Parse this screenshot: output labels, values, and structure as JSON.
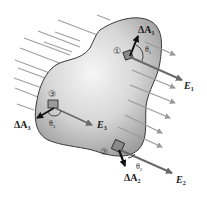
{
  "diagram": {
    "colors": {
      "field_line": "#9a9a9a",
      "surface_outline": "#3a3a3a",
      "surface_fill_light": "#f4f4f4",
      "surface_fill_dark": "#a8a8a8",
      "area_vector": "#111111",
      "field_vector": "#6a6a6a",
      "text": "#1a1a1a"
    },
    "patches": [
      {
        "id": "1",
        "circle_label": "①",
        "area_label": "ΔA",
        "area_sub": "1",
        "field_label": "E",
        "field_sub": "1",
        "angle_label": "θ",
        "angle_sub": "1"
      },
      {
        "id": "2",
        "circle_label": "②",
        "area_label": "ΔA",
        "area_sub": "2",
        "field_label": "E",
        "field_sub": "2",
        "angle_label": "θ",
        "angle_sub": "2"
      },
      {
        "id": "3",
        "circle_label": "③",
        "area_label": "ΔA",
        "area_sub": "3",
        "field_label": "E",
        "field_sub": "3",
        "angle_label": "θ",
        "angle_sub": "3"
      }
    ]
  }
}
